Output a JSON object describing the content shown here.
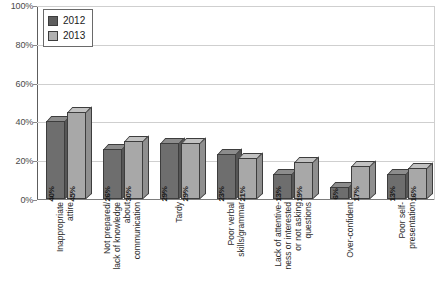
{
  "chart_data": {
    "type": "bar",
    "title": "",
    "subtitle": "",
    "xlabel": "",
    "ylabel": "",
    "ylim": [
      0,
      100
    ],
    "yticks": [
      "0%",
      "20%",
      "40%",
      "60%",
      "80%",
      "100%"
    ],
    "ytick_values": [
      0,
      20,
      40,
      60,
      80,
      100
    ],
    "grid": true,
    "legend_position": "top-left",
    "value_label_suffix": "%",
    "categories": [
      "Inappropriate\nattire",
      "Not prepared/\nlack of knowledge\nabout\ncommunication",
      "Tardy",
      "Poor verbal\nskills/grammar",
      "Lack of attentive-\nness or interested\nor not asking\nquestions",
      "Over-confident",
      "Poor self-\npresentation"
    ],
    "series": [
      {
        "name": "2012",
        "color": "#6e6e6e",
        "values": [
          40,
          26,
          29,
          23,
          13,
          6,
          13
        ],
        "labels": [
          "40%",
          "26%",
          "29%",
          "23%",
          "13%",
          "6%",
          "13%"
        ]
      },
      {
        "name": "2013",
        "color": "#a8a8a8",
        "values": [
          45,
          30,
          29,
          21,
          19,
          17,
          16
        ],
        "labels": [
          "45%",
          "30%",
          "29%",
          "21%",
          "19%",
          "17%",
          "16%"
        ]
      }
    ]
  },
  "legend": {
    "items": [
      {
        "label": "2012",
        "swatch": "legend-swatch-2012"
      },
      {
        "label": "2013",
        "swatch": "legend-swatch-2013"
      }
    ]
  }
}
